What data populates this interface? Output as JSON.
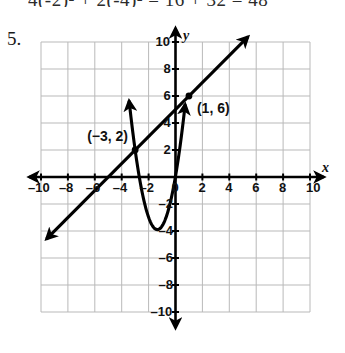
{
  "page": {
    "top_equation_clipped": "4(-2)² + 2(-4)² = 16 + 32 = 48",
    "problem_number": "5."
  },
  "chart_data": {
    "type": "line",
    "title": "",
    "xlabel": "x",
    "ylabel": "y",
    "xlim": [
      -10,
      10
    ],
    "ylim": [
      -10,
      10
    ],
    "grid": true,
    "grid_step": 2,
    "tick_step": 2,
    "legend": "none",
    "x_ticks": [
      "-10",
      "-8",
      "-6",
      "-4",
      "-2",
      "0",
      "2",
      "4",
      "6",
      "8",
      "10"
    ],
    "x_tick_values": [
      -10,
      -8,
      -6,
      -4,
      -2,
      0,
      2,
      4,
      6,
      8,
      10
    ],
    "y_ticks": [
      "10",
      "8",
      "6",
      "4",
      "2",
      "-2",
      "-4",
      "-6",
      "-8",
      "-10"
    ],
    "y_tick_values": [
      10,
      8,
      6,
      4,
      2,
      -2,
      -4,
      -6,
      -8,
      -10
    ],
    "series": [
      {
        "name": "line",
        "kind": "line",
        "equation": "y = x + 5",
        "slope": 1,
        "intercept": 5,
        "x_start": -9.6,
        "x_end": 5.4,
        "arrows": "both"
      },
      {
        "name": "parabola",
        "kind": "parabola",
        "equation": "y = 4x² + 11x + 2",
        "vertex": [
          -1.35,
          -3.9
        ],
        "x_start": -3.45,
        "x_end": 0.72,
        "arrows": "both"
      }
    ],
    "points": [
      {
        "label": "(−3, 2)",
        "x": -3,
        "y": 2
      },
      {
        "label": "(1, 6)",
        "x": 1,
        "y": 6
      }
    ],
    "annotations": [
      {
        "text": "(−3, 2)",
        "x": -3,
        "y": 2
      },
      {
        "text": "(1, 6)",
        "x": 1,
        "y": 6
      }
    ]
  },
  "colors": {
    "grid": "#b9b9b9",
    "axis": "#000000",
    "curve": "#000000",
    "background": "#ffffff"
  }
}
